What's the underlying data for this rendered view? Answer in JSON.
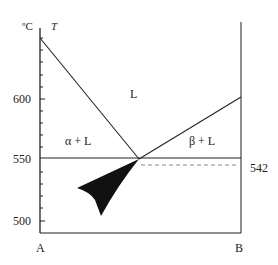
{
  "diagram": {
    "type": "binary eutectic phase diagram",
    "axis": {
      "unit_label": "ºC",
      "variable_label": "T",
      "ticks": [
        {
          "label": "600",
          "value": 600
        },
        {
          "label": "550",
          "value": 550
        },
        {
          "label": "500",
          "value": 500
        }
      ],
      "left_component": "A",
      "right_component": "B"
    },
    "regions": {
      "liquid": "L",
      "alpha_liquid": "α + L",
      "beta_liquid": "β + L"
    },
    "eutectic_temperature": 550,
    "dashed_line_label": "542",
    "colors": {
      "line": "#222222",
      "dashed": "#777777",
      "fill": "#111111"
    }
  }
}
